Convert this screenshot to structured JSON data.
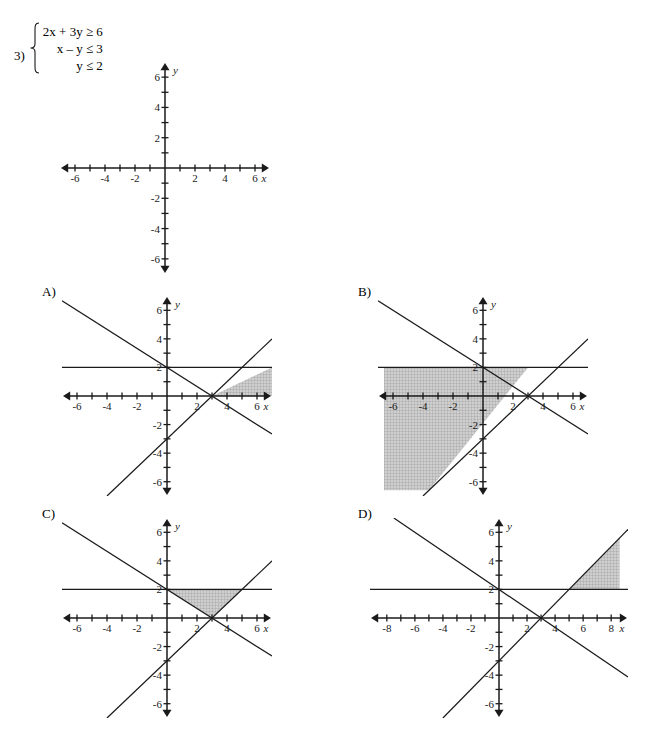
{
  "problem": {
    "number": "3)",
    "inequalities": [
      "2x + 3y ≥ 6",
      "x – y ≤ 3",
      "y ≤ 2"
    ],
    "brace_icon": "left-curly-brace-icon"
  },
  "options": [
    {
      "key": "A",
      "label": "A)"
    },
    {
      "key": "B",
      "label": "B)"
    },
    {
      "key": "C",
      "label": "C)"
    },
    {
      "key": "D",
      "label": "D)"
    }
  ],
  "style": {
    "line_color": "#1a1a1a",
    "axis_color": "#1a1a1a",
    "shade_fill": "#b9b9b9",
    "shade_stroke": "#8c8c8c",
    "background": "#ffffff"
  },
  "chart_data": [
    {
      "id": "problem-graph",
      "type": "scatter",
      "title": "",
      "xlabel": "x",
      "ylabel": "y",
      "xlim": [
        -7,
        7
      ],
      "ylim": [
        -7,
        7
      ],
      "xticks": [
        -6,
        -5,
        -4,
        -3,
        -2,
        -1,
        1,
        2,
        3,
        4,
        5,
        6
      ],
      "yticks": [
        -6,
        -5,
        -4,
        -3,
        -2,
        -1,
        1,
        2,
        3,
        4,
        5,
        6
      ],
      "xtick_labels": [
        {
          "value": -6,
          "text": "-6"
        },
        {
          "value": -4,
          "text": "-4"
        },
        {
          "value": -2,
          "text": "-2"
        },
        {
          "value": 2,
          "text": "2"
        },
        {
          "value": 4,
          "text": "4"
        },
        {
          "value": 6,
          "text": "6"
        }
      ],
      "ytick_labels": [
        {
          "value": -6,
          "text": "-6"
        },
        {
          "value": -4,
          "text": "-4"
        },
        {
          "value": -2,
          "text": "-2"
        },
        {
          "value": 2,
          "text": "2"
        },
        {
          "value": 4,
          "text": "4"
        },
        {
          "value": 6,
          "text": "6"
        }
      ],
      "grid": false,
      "legend": "none",
      "lines": [],
      "shaded_regions": []
    },
    {
      "id": "option-a-graph",
      "type": "scatter",
      "title": "A)",
      "xlabel": "x",
      "ylabel": "y",
      "xlim": [
        -7,
        7
      ],
      "ylim": [
        -7,
        7
      ],
      "xticks": [
        -6,
        -5,
        -4,
        -3,
        -2,
        -1,
        1,
        2,
        3,
        4,
        5,
        6
      ],
      "yticks": [
        -6,
        -5,
        -4,
        -3,
        -2,
        -1,
        1,
        2,
        3,
        4,
        5,
        6
      ],
      "xtick_labels": [
        {
          "value": -6,
          "text": "-6"
        },
        {
          "value": -4,
          "text": "-4"
        },
        {
          "value": -2,
          "text": "-2"
        },
        {
          "value": 2,
          "text": "2"
        },
        {
          "value": 4,
          "text": "4"
        },
        {
          "value": 6,
          "text": "6"
        }
      ],
      "ytick_labels": [
        {
          "value": -6,
          "text": "-6"
        },
        {
          "value": -4,
          "text": "-4"
        },
        {
          "value": -2,
          "text": "-2"
        },
        {
          "value": 2,
          "text": "2"
        },
        {
          "value": 4,
          "text": "4"
        },
        {
          "value": 6,
          "text": "6"
        }
      ],
      "grid": false,
      "legend": "none",
      "lines": [
        {
          "name": "2x + 3y = 6",
          "slope": -0.6666667,
          "intercept": 2
        },
        {
          "name": "x - y = 3",
          "slope": 1,
          "intercept": -3
        },
        {
          "name": "y = 2",
          "slope": 0,
          "intercept": 2
        }
      ],
      "shaded_regions": [
        {
          "name": "region-right-of-intersection",
          "polygon": [
            [
              3,
              0
            ],
            [
              7,
              0
            ],
            [
              7,
              2
            ],
            [
              3,
              0
            ]
          ],
          "description": "wedge right of x - y = 3, below y = 2, right of 2x + 3y = 6"
        }
      ]
    },
    {
      "id": "option-b-graph",
      "type": "scatter",
      "title": "B)",
      "xlabel": "x",
      "ylabel": "y",
      "xlim": [
        -7,
        7
      ],
      "ylim": [
        -7,
        7
      ],
      "xticks": [
        -6,
        -5,
        -4,
        -3,
        -2,
        -1,
        1,
        2,
        3,
        4,
        5,
        6
      ],
      "yticks": [
        -6,
        -5,
        -4,
        -3,
        -2,
        -1,
        1,
        2,
        3,
        4,
        5,
        6
      ],
      "xtick_labels": [
        {
          "value": -6,
          "text": "-6"
        },
        {
          "value": -4,
          "text": "-4"
        },
        {
          "value": -2,
          "text": "-2"
        },
        {
          "value": 2,
          "text": "2"
        },
        {
          "value": 4,
          "text": "4"
        },
        {
          "value": 6,
          "text": "6"
        }
      ],
      "ytick_labels": [
        {
          "value": -6,
          "text": "-6"
        },
        {
          "value": -4,
          "text": "-4"
        },
        {
          "value": -2,
          "text": "-2"
        },
        {
          "value": 2,
          "text": "2"
        },
        {
          "value": 4,
          "text": "4"
        },
        {
          "value": 6,
          "text": "6"
        }
      ],
      "grid": false,
      "legend": "none",
      "lines": [
        {
          "name": "2x + 3y = 6",
          "slope": -0.6666667,
          "intercept": 2
        },
        {
          "name": "x - y = 3",
          "slope": 1,
          "intercept": -3
        },
        {
          "name": "y = 2",
          "slope": 0,
          "intercept": 2
        }
      ],
      "shaded_regions": [
        {
          "name": "region-left-below",
          "polygon": [
            [
              -6.6,
              2
            ],
            [
              3,
              2
            ],
            [
              -3.6,
              -6.6
            ],
            [
              -6.6,
              -6.6
            ]
          ],
          "description": "left region under y = 2 and left of x - y = 3"
        }
      ]
    },
    {
      "id": "option-c-graph",
      "type": "scatter",
      "title": "C)",
      "xlabel": "x",
      "ylabel": "y",
      "xlim": [
        -7,
        7
      ],
      "ylim": [
        -7,
        7
      ],
      "xticks": [
        -6,
        -5,
        -4,
        -3,
        -2,
        -1,
        1,
        2,
        3,
        4,
        5,
        6
      ],
      "yticks": [
        -6,
        -5,
        -4,
        -3,
        -2,
        -1,
        1,
        2,
        3,
        4,
        5,
        6
      ],
      "xtick_labels": [
        {
          "value": -6,
          "text": "-6"
        },
        {
          "value": -4,
          "text": "-4"
        },
        {
          "value": -2,
          "text": "-2"
        },
        {
          "value": 2,
          "text": "2"
        },
        {
          "value": 4,
          "text": "4"
        },
        {
          "value": 6,
          "text": "6"
        }
      ],
      "ytick_labels": [
        {
          "value": -6,
          "text": "-6"
        },
        {
          "value": -4,
          "text": "-4"
        },
        {
          "value": -2,
          "text": "-2"
        },
        {
          "value": 2,
          "text": "2"
        },
        {
          "value": 4,
          "text": "4"
        },
        {
          "value": 6,
          "text": "6"
        }
      ],
      "grid": false,
      "legend": "none",
      "lines": [
        {
          "name": "2x + 3y = 6",
          "slope": -0.6666667,
          "intercept": 2
        },
        {
          "name": "x - y = 3",
          "slope": 1,
          "intercept": -3
        },
        {
          "name": "y = 2",
          "slope": 0,
          "intercept": 2
        }
      ],
      "shaded_regions": [
        {
          "name": "solution-triangle",
          "polygon": [
            [
              0,
              2
            ],
            [
              5,
              2
            ],
            [
              3,
              0
            ]
          ],
          "description": "triangle bounded by y = 2, 2x + 3y = 6 and x - y = 3"
        }
      ]
    },
    {
      "id": "option-d-graph",
      "type": "scatter",
      "title": "D)",
      "xlabel": "x",
      "ylabel": "y",
      "xlim": [
        -9.2,
        9.2
      ],
      "ylim": [
        -7,
        7
      ],
      "xticks": [
        -8,
        -7,
        -6,
        -5,
        -4,
        -3,
        -2,
        -1,
        1,
        2,
        3,
        4,
        5,
        6,
        7,
        8
      ],
      "yticks": [
        -6,
        -5,
        -4,
        -3,
        -2,
        -1,
        1,
        2,
        3,
        4,
        5,
        6
      ],
      "xtick_labels": [
        {
          "value": -8,
          "text": "-8"
        },
        {
          "value": -6,
          "text": "-6"
        },
        {
          "value": -4,
          "text": "-4"
        },
        {
          "value": -2,
          "text": "-2"
        },
        {
          "value": 2,
          "text": "2"
        },
        {
          "value": 4,
          "text": "4"
        },
        {
          "value": 6,
          "text": "6"
        },
        {
          "value": 8,
          "text": "8"
        }
      ],
      "ytick_labels": [
        {
          "value": -6,
          "text": "-6"
        },
        {
          "value": -4,
          "text": "-4"
        },
        {
          "value": -2,
          "text": "-2"
        },
        {
          "value": 2,
          "text": "2"
        },
        {
          "value": 4,
          "text": "4"
        },
        {
          "value": 6,
          "text": "6"
        }
      ],
      "grid": false,
      "legend": "none",
      "lines": [
        {
          "name": "2x + 3y = 6",
          "slope": -0.6666667,
          "intercept": 2
        },
        {
          "name": "x - y = 3",
          "slope": 1,
          "intercept": -3
        },
        {
          "name": "y = 2",
          "slope": 0,
          "intercept": 2
        }
      ],
      "shaded_regions": [
        {
          "name": "region-above-y2",
          "polygon": [
            [
              5,
              2
            ],
            [
              8.6,
              2
            ],
            [
              8.6,
              5.6
            ]
          ],
          "description": "triangle above y = 2 and left of x - y = 3, right side"
        }
      ]
    }
  ]
}
